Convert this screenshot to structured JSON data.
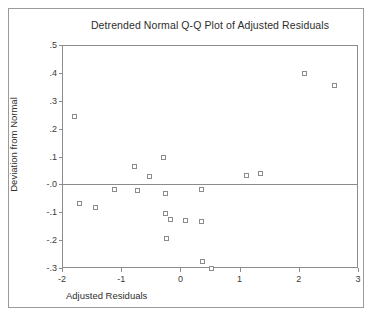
{
  "chart_data": {
    "type": "scatter",
    "title": "Detrended Normal Q-Q Plot of Adjusted Residuals",
    "xlabel": "Adjusted Residuals",
    "ylabel": "Deviation from Normal",
    "xlim": [
      -2,
      3
    ],
    "ylim": [
      -0.3,
      0.5
    ],
    "xticks": [
      -2,
      -1,
      0,
      1,
      2,
      3
    ],
    "xtick_labels": [
      "-2",
      "-1",
      "0",
      "1",
      "2",
      "3"
    ],
    "yticks": [
      0.5,
      0.4,
      0.3,
      0.2,
      0.1,
      0.0,
      -0.1,
      -0.2,
      -0.3
    ],
    "ytick_labels": [
      ".5",
      ".4",
      ".3",
      ".2",
      ".1",
      "-.0",
      "-.1",
      "-.2",
      "-.3"
    ],
    "grid": false,
    "legend": null,
    "reference_line": {
      "y": 0.0,
      "color": "#8a8a8a"
    },
    "marker": {
      "shape": "open-square",
      "size": 5,
      "color": "#8b8b8b"
    },
    "x": [
      -1.79,
      -1.7,
      -1.43,
      -1.11,
      -0.78,
      -0.72,
      -0.53,
      -0.28,
      -0.26,
      -0.25,
      -0.23,
      -0.16,
      0.08,
      0.35,
      0.36,
      0.37,
      0.52,
      1.11,
      1.35,
      2.09,
      2.6
    ],
    "y": [
      0.245,
      -0.068,
      -0.083,
      -0.02,
      0.065,
      -0.022,
      0.03,
      0.096,
      -0.032,
      -0.103,
      -0.195,
      -0.126,
      -0.128,
      -0.02,
      -0.132,
      -0.277,
      -0.302,
      0.032,
      0.038,
      0.397,
      0.355
    ],
    "series": [
      {
        "name": "Adjusted Residuals",
        "points": [
          {
            "x": -1.79,
            "y": 0.245
          },
          {
            "x": -1.7,
            "y": -0.068
          },
          {
            "x": -1.43,
            "y": -0.083
          },
          {
            "x": -1.11,
            "y": -0.02
          },
          {
            "x": -0.78,
            "y": 0.065
          },
          {
            "x": -0.72,
            "y": -0.022
          },
          {
            "x": -0.53,
            "y": 0.03
          },
          {
            "x": -0.28,
            "y": 0.096
          },
          {
            "x": -0.26,
            "y": -0.032
          },
          {
            "x": -0.25,
            "y": -0.103
          },
          {
            "x": -0.23,
            "y": -0.195
          },
          {
            "x": -0.16,
            "y": -0.126
          },
          {
            "x": 0.08,
            "y": -0.128
          },
          {
            "x": 0.35,
            "y": -0.02
          },
          {
            "x": 0.36,
            "y": -0.132
          },
          {
            "x": 0.37,
            "y": -0.277
          },
          {
            "x": 0.52,
            "y": -0.302
          },
          {
            "x": 1.11,
            "y": 0.032
          },
          {
            "x": 1.35,
            "y": 0.038
          },
          {
            "x": 2.09,
            "y": 0.397
          },
          {
            "x": 2.6,
            "y": 0.355
          }
        ]
      }
    ]
  }
}
